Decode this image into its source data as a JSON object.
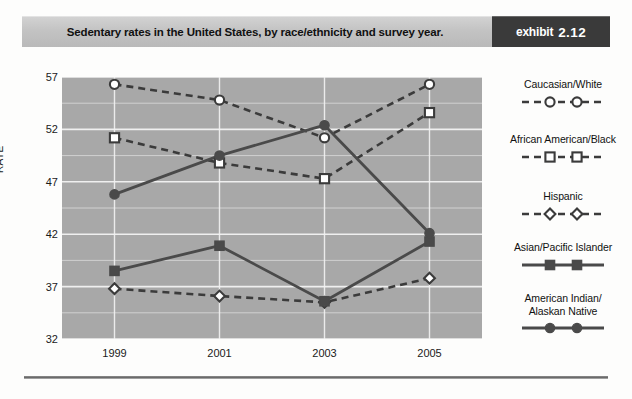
{
  "header": {
    "title": "Sedentary rates in the United States, by race/ethnicity and survey year.",
    "exhibit_word": "exhibit",
    "exhibit_number": "2.12"
  },
  "chart_data": {
    "type": "line",
    "title": "Sedentary rates in the United States, by race/ethnicity and survey year.",
    "xlabel": "",
    "ylabel": "RATE",
    "categories": [
      "1999",
      "2001",
      "2003",
      "2005"
    ],
    "x": [
      1999,
      2001,
      2003,
      2005
    ],
    "ylim": [
      32,
      57
    ],
    "yticks": [
      "32",
      "37",
      "42",
      "47",
      "52",
      "57"
    ],
    "ytick_values": [
      32,
      37,
      42,
      47,
      52,
      57
    ],
    "minor_gridlines": true,
    "minor_tick_step": 2.5,
    "grid": true,
    "legend_position": "right",
    "plot_background": "#a8a8a8",
    "gridline_color": "#f2f2f2",
    "series": [
      {
        "name": "Caucasian/White",
        "marker": "circle-open",
        "line_style": "dashed",
        "color": "#3b3b3b",
        "values": [
          56.3,
          54.8,
          51.2,
          56.3
        ]
      },
      {
        "name": "African American/Black",
        "marker": "square-open",
        "line_style": "dashed",
        "color": "#3b3b3b",
        "values": [
          51.2,
          48.8,
          47.3,
          53.6
        ]
      },
      {
        "name": "Hispanic",
        "marker": "diamond-open",
        "line_style": "dashed",
        "color": "#3b3b3b",
        "values": [
          36.8,
          36.1,
          35.5,
          37.8
        ]
      },
      {
        "name": "Asian/Pacific Islander",
        "marker": "square-filled",
        "line_style": "solid",
        "color": "#4a4a4a",
        "values": [
          38.5,
          40.9,
          35.6,
          41.3
        ]
      },
      {
        "name": "American Indian/\nAlaskan Native",
        "marker": "circle-filled",
        "line_style": "solid",
        "color": "#4a4a4a",
        "values": [
          45.8,
          49.5,
          52.4,
          42.1
        ]
      }
    ]
  },
  "legend": {
    "items": [
      {
        "label_line1": "Caucasian/White",
        "label_line2": ""
      },
      {
        "label_line1": "African American/Black",
        "label_line2": ""
      },
      {
        "label_line1": "Hispanic",
        "label_line2": ""
      },
      {
        "label_line1": "Asian/Pacific Islander",
        "label_line2": ""
      },
      {
        "label_line1": "American Indian/",
        "label_line2": "Alaskan Native"
      }
    ]
  }
}
